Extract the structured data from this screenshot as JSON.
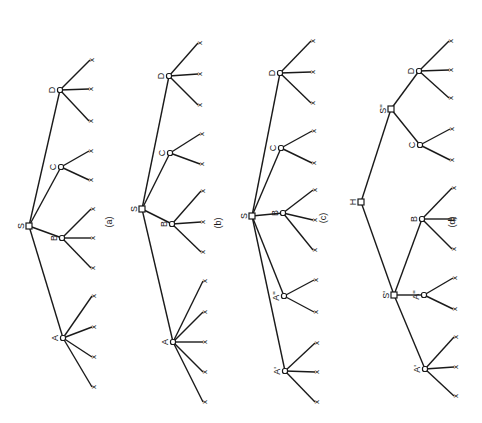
{
  "figure": {
    "orientation": "rotated 90deg clockwise (text reads bottom-to-top)",
    "leaf_glyph": "x",
    "panels": [
      {
        "caption": "(a)",
        "caption_pos": [
          110,
          222
        ],
        "nodes": [
          {
            "id": "S",
            "label": "S",
            "x": 29,
            "y": 226,
            "leaves": []
          },
          {
            "id": "D",
            "label": "D",
            "x": 60,
            "y": 90,
            "parent": "S",
            "leaves": [
              [
                92,
                60
              ],
              [
                91,
                89
              ],
              [
                91,
                121
              ]
            ]
          },
          {
            "id": "C",
            "label": "C",
            "x": 61,
            "y": 167,
            "parent": "S",
            "leaves": [
              [
                91,
                151
              ],
              [
                91,
                180
              ]
            ]
          },
          {
            "id": "B",
            "label": "B",
            "x": 62,
            "y": 238,
            "parent": "S",
            "leaves": [
              [
                93,
                209
              ],
              [
                93,
                238
              ],
              [
                93,
                268
              ]
            ]
          },
          {
            "id": "A",
            "label": "A",
            "x": 63,
            "y": 338,
            "parent": "S",
            "leaves": [
              [
                94,
                296
              ],
              [
                94,
                327
              ],
              [
                94,
                357
              ],
              [
                94,
                387
              ]
            ]
          }
        ]
      },
      {
        "caption": "(b)",
        "caption_pos": [
          219,
          223
        ],
        "nodes": [
          {
            "id": "S",
            "label": "S",
            "x": 142,
            "y": 209,
            "leaves": []
          },
          {
            "id": "D",
            "label": "D",
            "x": 169,
            "y": 76,
            "parent": "S",
            "leaves": [
              [
                200,
                43
              ],
              [
                200,
                74
              ],
              [
                200,
                105
              ]
            ]
          },
          {
            "id": "C",
            "label": "C",
            "x": 170,
            "y": 153,
            "parent": "S",
            "leaves": [
              [
                202,
                134
              ],
              [
                202,
                164
              ]
            ]
          },
          {
            "id": "B",
            "label": "B",
            "x": 172,
            "y": 224,
            "parent": "S",
            "leaves": [
              [
                203,
                191
              ],
              [
                203,
                222
              ],
              [
                203,
                252
              ]
            ]
          },
          {
            "id": "A",
            "label": "A",
            "x": 173,
            "y": 342,
            "parent": "S",
            "leaves": [
              [
                205,
                281
              ],
              [
                205,
                312
              ],
              [
                205,
                342
              ],
              [
                205,
                372
              ],
              [
                205,
                402
              ]
            ]
          }
        ]
      },
      {
        "caption": "(c)",
        "caption_pos": [
          324,
          218
        ],
        "nodes": [
          {
            "id": "S",
            "label": "S",
            "x": 252,
            "y": 216,
            "leaves": []
          },
          {
            "id": "D",
            "label": "D",
            "x": 280,
            "y": 73,
            "parent": "S",
            "leaves": [
              [
                313,
                41
              ],
              [
                313,
                72
              ],
              [
                313,
                103
              ]
            ]
          },
          {
            "id": "C",
            "label": "C",
            "x": 281,
            "y": 148,
            "parent": "S",
            "leaves": [
              [
                314,
                131
              ],
              [
                314,
                163
              ]
            ]
          },
          {
            "id": "B",
            "label": "B",
            "x": 283,
            "y": 213,
            "parent": "S",
            "leaves": [
              [
                315,
                190
              ],
              [
                315,
                220
              ],
              [
                315,
                250
              ]
            ]
          },
          {
            "id": "A2",
            "label": "A''",
            "x": 284,
            "y": 296,
            "parent": "S",
            "leaves": [
              [
                316,
                280
              ],
              [
                316,
                312
              ]
            ]
          },
          {
            "id": "A1",
            "label": "A'",
            "x": 285,
            "y": 371,
            "parent": "S",
            "leaves": [
              [
                317,
                343
              ],
              [
                317,
                372
              ],
              [
                317,
                402
              ]
            ]
          }
        ]
      },
      {
        "caption": "(d)",
        "caption_pos": [
          453,
          222
        ],
        "nodes": [
          {
            "id": "H",
            "label": "H",
            "x": 361,
            "y": 202,
            "leaves": []
          },
          {
            "id": "S2",
            "label": "S''",
            "x": 391,
            "y": 109,
            "parent": "H",
            "leaves": []
          },
          {
            "id": "D",
            "label": "D",
            "x": 419,
            "y": 71,
            "parent": "S2",
            "leaves": [
              [
                451,
                41
              ],
              [
                451,
                70
              ],
              [
                451,
                98
              ]
            ]
          },
          {
            "id": "C",
            "label": "C",
            "x": 420,
            "y": 145,
            "parent": "S2",
            "leaves": [
              [
                452,
                129
              ],
              [
                452,
                160
              ]
            ]
          },
          {
            "id": "S1",
            "label": "S'",
            "x": 394,
            "y": 295,
            "parent": "H",
            "leaves": []
          },
          {
            "id": "B",
            "label": "B",
            "x": 422,
            "y": 219,
            "parent": "S1",
            "leaves": [
              [
                454,
                188
              ],
              [
                454,
                219
              ],
              [
                454,
                249
              ]
            ]
          },
          {
            "id": "A2",
            "label": "A''",
            "x": 424,
            "y": 295,
            "parent": "S1",
            "leaves": [
              [
                455,
                278
              ],
              [
                455,
                309
              ]
            ]
          },
          {
            "id": "A1",
            "label": "A'",
            "x": 425,
            "y": 369,
            "parent": "S1",
            "leaves": [
              [
                456,
                337
              ],
              [
                456,
                367
              ],
              [
                456,
                396
              ]
            ]
          }
        ]
      }
    ]
  }
}
